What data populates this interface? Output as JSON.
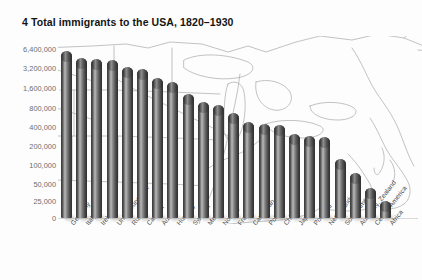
{
  "chart_data": {
    "type": "bar",
    "title": "4  Total immigrants to the USA, 1820–1930",
    "title_number": "4",
    "title_text": "Total immigrants to the USA, 1820–1930",
    "xlabel": "",
    "ylabel": "",
    "scale": "log",
    "grid": false,
    "legend": null,
    "background": "outline-map-of-united-states",
    "ytick_labels": [
      "6,400,000",
      "3,200,000",
      "1,600,000",
      "800,000",
      "400,000",
      "200,000",
      "100,000",
      "50,000",
      "25,000",
      "0"
    ],
    "ytick_values": [
      6400000,
      3200000,
      1600000,
      800000,
      400000,
      200000,
      100000,
      50000,
      25000,
      0
    ],
    "ylim": [
      0,
      6400000
    ],
    "categories": [
      "Germany",
      "Italy",
      "Ireland",
      "United Kingdom",
      "Russia",
      "Canada",
      "Austria",
      "Hungary",
      "Sweden",
      "Mexico",
      "Norway",
      "France",
      "Caribbean",
      "Poland",
      "China",
      "Japan",
      "Portugal",
      "Netherlands",
      "South America",
      "Austl'a/N. Zealand",
      "Central America",
      "Africa"
    ],
    "values": [
      5900000,
      4600000,
      4400000,
      4200000,
      3300000,
      3100000,
      2200000,
      1900000,
      1200000,
      900000,
      800000,
      600000,
      440000,
      400000,
      390000,
      280000,
      260000,
      250000,
      110000,
      65000,
      38000,
      23000
    ],
    "value_labels": [
      "5,900,000",
      "4,600,000",
      "4,400,000",
      "4,200,000",
      "3,300,000",
      "3,100,000",
      "2,200,000",
      "1,900,000",
      "1,200,000",
      "900,000",
      "800,000",
      "600,000",
      "440,000",
      "400,000",
      "390,000",
      "280,000",
      "260,000",
      "250,000",
      "110,000",
      "65,000",
      "38,000",
      "23,000"
    ],
    "colors": {
      "bar_dark": "#333333",
      "bar_light": "#b9b9b9",
      "axis_text": "#6d6d6d",
      "title_text": "#141414",
      "map_outline": "#8d8d8d",
      "background": "#ffffff"
    }
  }
}
